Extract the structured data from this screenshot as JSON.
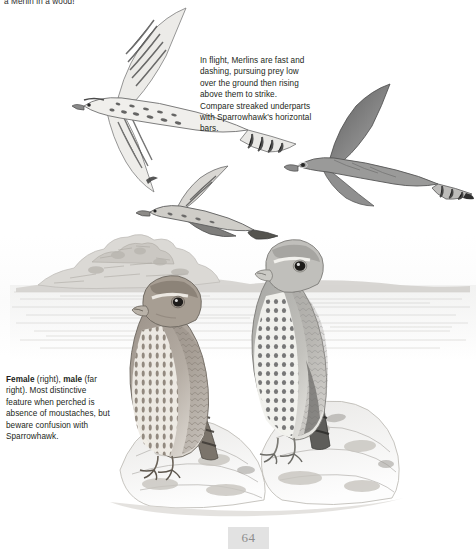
{
  "page": {
    "background_color": "#ffffff",
    "ink_color": "#231f20",
    "folio_number": "64",
    "folio_background": "#e2e2e2"
  },
  "clipped_heading": {
    "text": "a Merlin in a wood!"
  },
  "captions": {
    "flight": {
      "name": "flight-caption",
      "text": "In flight, Merlins are fast and dashing, pursuing prey low over the ground then rising above them to strike. Compare streaked underparts with Sparrowhawk's horizontal bars."
    },
    "perched": {
      "name": "perched-caption",
      "lead_bold_1": "Female",
      "lead_plain_1": " (right), ",
      "lead_bold_2": "male",
      "rest": " (far right). Most distinctive feature when perched is absence of moustaches, but beware confusion with Sparrowhawk."
    }
  },
  "illustration": {
    "subject": "Merlin (Falco columbarius)",
    "medium": "pencil / graphite field-guide plate",
    "background_scene": "low rocky hill on a flat moorland horizon with pale hazy sky",
    "figures": [
      {
        "id": "flight-upper-left",
        "label": "merlin-in-flight-underside",
        "pose": "banking flight seen from below, wings spread, streaked underparts, barred tail",
        "tone": "pale with dark streaking"
      },
      {
        "id": "flight-right",
        "label": "merlin-in-flight-upperside",
        "pose": "gliding flight seen from above, pointed wings, banded tail tip",
        "tone": "dark slate grey"
      },
      {
        "id": "flight-centre-low",
        "label": "merlin-stooping",
        "pose": "low fast flight, wings swept back, hunting close to the ground",
        "tone": "mid grey"
      },
      {
        "id": "perched-female",
        "label": "perched-female-merlin",
        "pose": "perched on rock facing left, heavily streaked breast, no moustachial stripe",
        "tone": "warm brown-grey"
      },
      {
        "id": "perched-male",
        "label": "perched-male-merlin",
        "pose": "perched upright on rock facing left, blue-grey upperparts, spotted flanks",
        "tone": "pale blue-grey"
      }
    ],
    "perch": "pale lichen-covered boulders across the lower third"
  }
}
